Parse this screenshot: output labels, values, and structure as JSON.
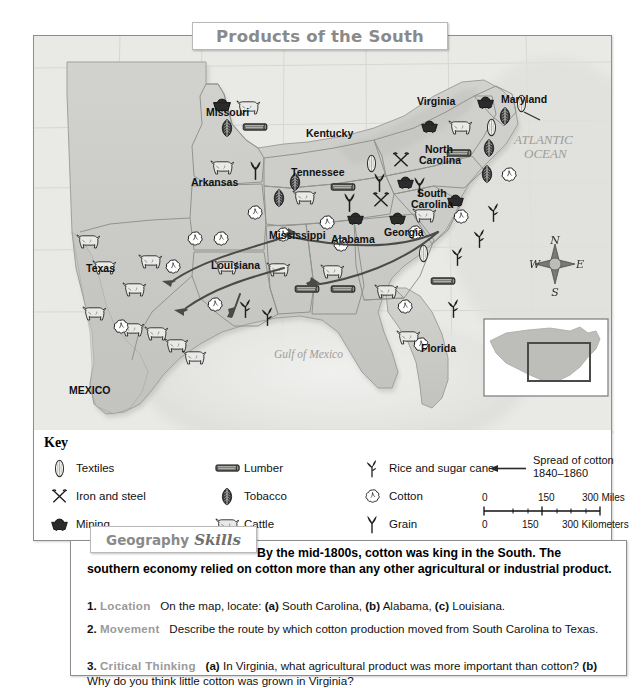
{
  "title": "Products of the South",
  "map": {
    "states": [
      {
        "name": "Missouri",
        "x": 205,
        "y": 112
      },
      {
        "name": "Kentucky",
        "x": 305,
        "y": 133
      },
      {
        "name": "Virginia",
        "x": 416,
        "y": 101
      },
      {
        "name": "Maryland",
        "x": 500,
        "y": 99
      },
      {
        "name": "Arkansas",
        "x": 190,
        "y": 182
      },
      {
        "name": "Tennessee",
        "x": 290,
        "y": 172
      },
      {
        "name": "North Carolina",
        "x": 424,
        "y": 153
      },
      {
        "name": "South Carolina",
        "x": 416,
        "y": 196
      },
      {
        "name": "Mississippi",
        "x": 268,
        "y": 235
      },
      {
        "name": "Alabama",
        "x": 330,
        "y": 239
      },
      {
        "name": "Georgia",
        "x": 383,
        "y": 232
      },
      {
        "name": "Louisiana",
        "x": 210,
        "y": 265
      },
      {
        "name": "Texas",
        "x": 85,
        "y": 268
      },
      {
        "name": "Florida",
        "x": 420,
        "y": 348
      },
      {
        "name": "MEXICO",
        "x": 68,
        "y": 390
      }
    ],
    "water_labels": [
      {
        "name": "ATLANTIC OCEAN",
        "line1": "ATLANTIC",
        "line2": "OCEAN",
        "x": 530,
        "y": 137
      },
      {
        "name": "Gulf of Mexico",
        "line1": "Gulf of Mexico",
        "line2": "",
        "x": 305,
        "y": 355
      }
    ],
    "compass": {
      "n": "N",
      "e": "E",
      "s": "S",
      "w": "W"
    },
    "inset": {
      "label": ""
    }
  },
  "key": {
    "title": "Key",
    "column1": [
      {
        "icon": "textiles-icon",
        "label": "Textiles"
      },
      {
        "icon": "iron-and-steel-icon",
        "label": "Iron and steel"
      },
      {
        "icon": "mining-icon",
        "label": "Mining"
      }
    ],
    "column2": [
      {
        "icon": "lumber-icon",
        "label": "Lumber"
      },
      {
        "icon": "tobacco-icon",
        "label": "Tobacco"
      },
      {
        "icon": "cattle-icon",
        "label": "Cattle"
      }
    ],
    "column3": [
      {
        "icon": "rice-and-sugar-cane-icon",
        "label": "Rice and sugar cane"
      },
      {
        "icon": "cotton-icon",
        "label": "Cotton"
      },
      {
        "icon": "grain-icon",
        "label": "Grain"
      }
    ],
    "spread": {
      "line1": "Spread of cotton",
      "line2": "1840–1860"
    },
    "scale": {
      "miles": [
        "0",
        "150",
        "300 Miles"
      ],
      "kilometers": [
        "0",
        "150",
        "300 Kilometers"
      ]
    }
  },
  "skills": {
    "tab_word1": "Geography",
    "tab_word2": "Skills",
    "intro": "By the mid-1800s, cotton was king in the South. The southern economy relied on cotton more than any other agricultural or industrial product.",
    "questions": [
      {
        "num": "1.",
        "head": "Location",
        "body_pre": "On the map, locate: ",
        "a_label": "(a)",
        "a_text": " South Carolina, ",
        "b_label": "(b)",
        "b_text": " Alabama, ",
        "c_label": "(c)",
        "c_text": " Louisiana.",
        "full": "On the map, locate: (a) South Carolina, (b) Alabama, (c) Louisiana."
      },
      {
        "num": "2.",
        "head": "Movement",
        "body_pre": "Describe the route by which cotton production moved from South Carolina to Texas.",
        "full": "Describe the route by which cotton production moved from South Carolina to Texas."
      },
      {
        "num": "3.",
        "head": "Critical Thinking",
        "a_label": "(a)",
        "a_text": " In Virginia, what agricultural product was more important than cotton? ",
        "b_label": "(b)",
        "b_text": " Why do you think little cotton was grown in Virginia?",
        "full": "(a) In Virginia, what agricultural product was more important than cotton? (b) Why do you think little cotton was grown in Virginia?"
      }
    ]
  },
  "colors": {
    "land": "#c9c9c5",
    "land_light": "#d6d6d2",
    "water": "#e6e6e3",
    "border": "#8d8d8d",
    "title_text": "#8a8a8a",
    "heading_gray": "#9a9a9a"
  }
}
